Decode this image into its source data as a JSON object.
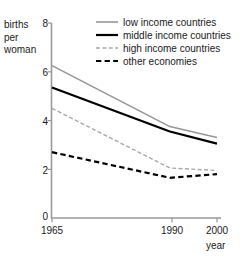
{
  "chart_data": {
    "type": "line",
    "title": "",
    "xlabel": "year",
    "ylabel": "births per woman",
    "ylabel_lines": [
      "births",
      "per",
      "woman"
    ],
    "x": [
      1965,
      1990,
      2000
    ],
    "xlim": [
      1965,
      2000
    ],
    "ylim": [
      0,
      8
    ],
    "xticks": [
      1965,
      1990,
      2000
    ],
    "xtick_labels": [
      "1965",
      "1990",
      "2000"
    ],
    "yticks": [
      0,
      2,
      4,
      6,
      8
    ],
    "ytick_labels": [
      "0",
      "2",
      "4",
      "6",
      "8"
    ],
    "grid": false,
    "legend_position": "top-right",
    "series": [
      {
        "name": "low income countries",
        "values": [
          6.25,
          3.75,
          3.3
        ],
        "color": "#969696",
        "style": "solid",
        "width": 1.6
      },
      {
        "name": "middle income countries",
        "values": [
          5.35,
          3.55,
          3.05
        ],
        "color": "#000000",
        "style": "solid",
        "width": 2.2
      },
      {
        "name": "high income countries",
        "values": [
          4.5,
          2.05,
          1.95
        ],
        "color": "#a8a8a8",
        "style": "dashed-fine",
        "width": 1.4
      },
      {
        "name": "other economies",
        "values": [
          2.7,
          1.65,
          1.8
        ],
        "color": "#000000",
        "style": "dashed",
        "width": 2.2
      }
    ]
  },
  "legend": {
    "items": [
      {
        "label": "low income countries"
      },
      {
        "label": "middle income countries"
      },
      {
        "label": "high income countries"
      },
      {
        "label": "other economies"
      }
    ]
  },
  "axes": {
    "axis_color": "#999999",
    "text_color": "#1a1a1a"
  }
}
